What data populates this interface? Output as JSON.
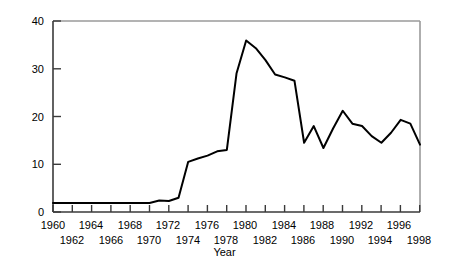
{
  "chart_data": {
    "type": "line",
    "title": "",
    "xlabel": "Year",
    "ylabel": "Price (US$ per barrel)",
    "xlim": [
      1960,
      1998
    ],
    "ylim": [
      0,
      40
    ],
    "grid": false,
    "legend": null,
    "y_ticks": [
      0,
      10,
      20,
      30,
      40
    ],
    "x_ticks": [
      1960,
      1962,
      1964,
      1966,
      1968,
      1970,
      1972,
      1974,
      1976,
      1978,
      1980,
      1982,
      1984,
      1986,
      1988,
      1990,
      1992,
      1994,
      1996,
      1998
    ],
    "x_tick_labels_upper": [
      "1960",
      "1964",
      "1968",
      "1972",
      "1976",
      "1980",
      "1984",
      "1988",
      "1992",
      "1996"
    ],
    "x_tick_labels_lower": [
      "1962",
      "1966",
      "1970",
      "1974",
      "1978",
      "1982",
      "1986",
      "1990",
      "1994",
      "1998"
    ],
    "series": [
      {
        "name": "Crude oil price",
        "color": "#000000",
        "x": [
          1960,
          1961,
          1962,
          1963,
          1964,
          1965,
          1966,
          1967,
          1968,
          1969,
          1970,
          1971,
          1972,
          1973,
          1974,
          1975,
          1976,
          1977,
          1978,
          1979,
          1980,
          1981,
          1982,
          1983,
          1984,
          1985,
          1986,
          1987,
          1988,
          1989,
          1990,
          1991,
          1992,
          1993,
          1994,
          1995,
          1996,
          1997,
          1998
        ],
        "values": [
          1.9,
          1.9,
          1.9,
          1.9,
          1.9,
          1.9,
          1.9,
          1.9,
          1.9,
          1.9,
          1.9,
          2.4,
          2.3,
          3.0,
          10.5,
          11.2,
          11.8,
          12.7,
          13.0,
          29.0,
          35.9,
          34.3,
          31.8,
          28.8,
          28.2,
          27.5,
          14.5,
          18.0,
          13.4,
          17.5,
          21.2,
          18.5,
          18.0,
          15.9,
          14.5,
          16.6,
          19.3,
          18.5,
          14.1
        ]
      }
    ]
  }
}
